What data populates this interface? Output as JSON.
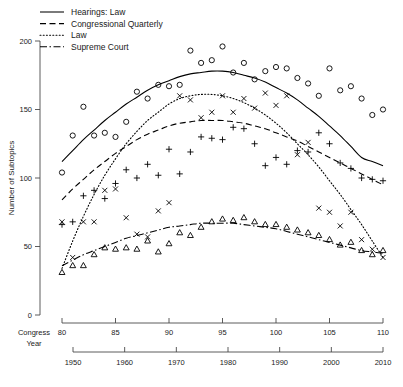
{
  "chart_data": {
    "type": "scatter",
    "title": "",
    "xlabel": "Congress",
    "ylabel": "Number of Subtopics",
    "grid": false,
    "legend_position": "top-left",
    "ylim": [
      0,
      200
    ],
    "yticks": [
      0,
      50,
      100,
      150,
      200
    ],
    "axes": [
      {
        "name": "Congress",
        "label": "Congress",
        "min": 80,
        "max": 110,
        "ticks": [
          80,
          85,
          90,
          95,
          100,
          105,
          110
        ]
      },
      {
        "name": "Year",
        "label": "Year",
        "min": 1947,
        "max": 2009,
        "ticks": [
          1950,
          1960,
          1970,
          1980,
          1990,
          2000,
          2010
        ]
      }
    ],
    "series": [
      {
        "name": "Hearings: Law",
        "line_style": "solid",
        "marker": "circle",
        "x": [
          80,
          81,
          82,
          83,
          84,
          85,
          86,
          87,
          88,
          89,
          90,
          91,
          92,
          93,
          94,
          95,
          96,
          97,
          98,
          99,
          100,
          101,
          102,
          103,
          104,
          105,
          106,
          107,
          108,
          109,
          110
        ],
        "values": [
          104,
          131,
          152,
          131,
          133,
          130,
          141,
          163,
          158,
          168,
          167,
          168,
          193,
          184,
          186,
          196,
          177,
          184,
          172,
          178,
          181,
          180,
          173,
          169,
          160,
          180,
          164,
          167,
          158,
          146,
          150
        ],
        "fit_values": [
          112,
          120,
          128,
          135,
          142,
          148,
          154,
          159,
          164,
          168,
          171,
          174,
          176,
          177,
          178,
          178,
          177,
          175,
          173,
          170,
          166,
          162,
          157,
          151,
          145,
          138,
          131,
          123,
          115,
          112,
          109
        ]
      },
      {
        "name": "Congressional Quarterly",
        "line_style": "dashed",
        "marker": "plus",
        "x": [
          80,
          81,
          82,
          83,
          84,
          85,
          86,
          87,
          88,
          89,
          90,
          91,
          92,
          93,
          94,
          95,
          96,
          97,
          98,
          99,
          100,
          101,
          102,
          103,
          104,
          105,
          106,
          107,
          108,
          109,
          110
        ],
        "values": [
          66,
          68,
          87,
          91,
          85,
          96,
          106,
          100,
          110,
          102,
          121,
          103,
          119,
          130,
          129,
          128,
          137,
          136,
          125,
          109,
          115,
          110,
          120,
          119,
          133,
          125,
          111,
          107,
          100,
          99,
          98
        ],
        "fit_values": [
          84,
          92,
          99,
          106,
          112,
          118,
          123,
          128,
          132,
          135,
          138,
          140,
          141,
          142,
          142,
          142,
          141,
          140,
          138,
          136,
          133,
          130,
          127,
          123,
          119,
          115,
          111,
          107,
          103,
          99,
          95
        ]
      },
      {
        "name": "Law",
        "line_style": "dotted",
        "marker": "cross",
        "x": [
          80,
          81,
          82,
          83,
          84,
          85,
          86,
          87,
          88,
          89,
          90,
          91,
          92,
          93,
          94,
          95,
          96,
          97,
          98,
          99,
          100,
          101,
          102,
          103,
          104,
          105,
          106,
          107,
          108,
          109,
          110
        ],
        "values": [
          68,
          42,
          68,
          68,
          91,
          92,
          71,
          59,
          57,
          76,
          82,
          160,
          157,
          144,
          148,
          160,
          148,
          158,
          151,
          162,
          153,
          160,
          117,
          126,
          78,
          75,
          65,
          75,
          55,
          48,
          42
        ],
        "fit_values": [
          34,
          54,
          72,
          88,
          102,
          114,
          125,
          134,
          142,
          148,
          154,
          158,
          160,
          161,
          161,
          160,
          158,
          155,
          151,
          146,
          140,
          133,
          125,
          117,
          108,
          98,
          88,
          77,
          66,
          54,
          42
        ]
      },
      {
        "name": "Supreme Court",
        "line_style": "dashdot",
        "marker": "triangle",
        "x": [
          80,
          81,
          82,
          83,
          84,
          85,
          86,
          87,
          88,
          89,
          90,
          91,
          92,
          93,
          94,
          95,
          96,
          97,
          98,
          99,
          100,
          101,
          102,
          103,
          104,
          105,
          106,
          107,
          108,
          109,
          110
        ],
        "values": [
          31,
          36,
          36,
          44,
          49,
          48,
          49,
          48,
          54,
          46,
          52,
          60,
          58,
          64,
          68,
          70,
          69,
          71,
          68,
          66,
          66,
          64,
          62,
          60,
          58,
          55,
          51,
          53,
          47,
          44,
          47
        ],
        "fit_values": [
          36,
          40,
          44,
          47,
          50,
          53,
          56,
          58,
          60,
          62,
          64,
          65,
          66,
          67,
          67,
          67,
          67,
          66,
          65,
          64,
          63,
          61,
          59,
          57,
          55,
          53,
          51,
          49,
          47,
          46,
          45
        ]
      }
    ]
  },
  "legend": {
    "items": [
      {
        "label": "Hearings: Law",
        "style": "solid"
      },
      {
        "label": "Congressional Quarterly",
        "style": "dashed"
      },
      {
        "label": "Law",
        "style": "dotted"
      },
      {
        "label": "Supreme Court",
        "style": "dashdot"
      }
    ]
  },
  "ytick_labels": [
    "0",
    "50",
    "100",
    "150",
    "200"
  ],
  "congress_tick_labels": [
    "80",
    "85",
    "90",
    "95",
    "100",
    "105",
    "110"
  ],
  "year_tick_labels": [
    "1950",
    "1960",
    "1970",
    "1980",
    "1990",
    "2000",
    "2010"
  ],
  "axis_names": {
    "congress": "Congress",
    "year": "Year"
  },
  "y_axis_title": "Number of Subtopics"
}
